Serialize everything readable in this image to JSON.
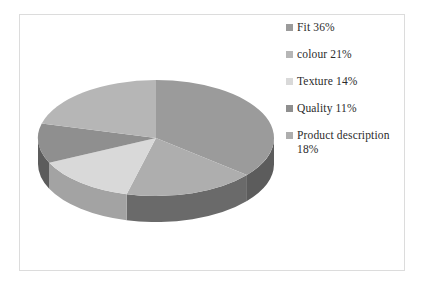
{
  "chart_data": {
    "type": "pie",
    "title": "",
    "legend_position": "right",
    "three_d": true,
    "start_angle_deg": 0,
    "direction": "clockwise",
    "categories": [
      "Fit",
      "colour",
      "Texture",
      "Quality",
      "Product description"
    ],
    "values": [
      36,
      21,
      14,
      11,
      18
    ],
    "units": "%",
    "labels": [
      "Fit  36%",
      "colour  21%",
      "Texture  14%",
      "Quality  11%",
      "Product description\n18%"
    ],
    "slices": [
      {
        "name": "Fit",
        "value": 36,
        "label": "Fit  36%",
        "color": "#9b9b9b",
        "side_color": "#5c5c5c"
      },
      {
        "name": "Product description",
        "value": 18,
        "label": "Product description\n18%",
        "color": "#aeaeae",
        "side_color": "#6a6a6a"
      },
      {
        "name": "Texture",
        "value": 14,
        "label": "Texture  14%",
        "color": "#d9d9d9",
        "side_color": "#a3a3a3"
      },
      {
        "name": "Quality",
        "value": 11,
        "label": "Quality  11%",
        "color": "#8f8f8f",
        "side_color": "#5c5c5c"
      },
      {
        "name": "colour",
        "value": 21,
        "label": "colour  21%",
        "color": "#b6b6b6",
        "side_color": "#7a7a7a"
      }
    ]
  },
  "legend": {
    "items": [
      {
        "label": "Fit  36%",
        "swatch_color": "#9b9b9b"
      },
      {
        "label": "colour  21%",
        "swatch_color": "#b6b6b6"
      },
      {
        "label": "Texture  14%",
        "swatch_color": "#d9d9d9"
      },
      {
        "label": "Quality  11%",
        "swatch_color": "#8f8f8f"
      },
      {
        "label": "Product description\n18%",
        "swatch_color": "#aeaeae"
      }
    ]
  },
  "colors": {
    "frame_border": "#dcdcdc",
    "background": "#ffffff",
    "text": "#2b2b2b"
  }
}
